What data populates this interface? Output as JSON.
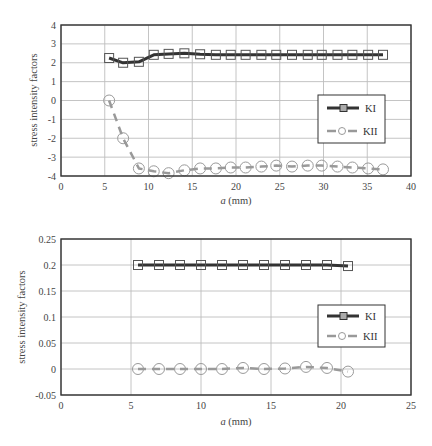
{
  "chart_data": [
    {
      "type": "line",
      "title": "",
      "xlabel": "a (mm)",
      "ylabel": "stress intensity factors",
      "xlim": [
        0,
        40
      ],
      "ylim": [
        -4,
        4
      ],
      "xticks": [
        0,
        5,
        10,
        15,
        20,
        25,
        30,
        35,
        40
      ],
      "yticks": [
        -4,
        -3,
        -2,
        -1,
        0,
        1,
        2,
        3,
        4
      ],
      "grid": true,
      "legend_position": "right-lower inside",
      "series": [
        {
          "name": "KI",
          "marker": "square",
          "line": "solid",
          "color": "#333333",
          "x": [
            5.5,
            7.1,
            8.9,
            10.6,
            12.3,
            14.1,
            15.9,
            17.7,
            19.4,
            21.1,
            22.9,
            24.6,
            26.4,
            28.2,
            29.8,
            31.6,
            33.3,
            35.1,
            36.8
          ],
          "values": [
            2.25,
            2.0,
            2.05,
            2.42,
            2.47,
            2.5,
            2.45,
            2.42,
            2.42,
            2.42,
            2.42,
            2.42,
            2.42,
            2.42,
            2.42,
            2.42,
            2.42,
            2.42,
            2.42
          ]
        },
        {
          "name": "KII",
          "marker": "circle",
          "line": "dashed",
          "color": "#999999",
          "x": [
            5.5,
            7.1,
            8.9,
            10.6,
            12.3,
            14.1,
            15.9,
            17.7,
            19.4,
            21.1,
            22.9,
            24.6,
            26.4,
            28.2,
            29.8,
            31.6,
            33.3,
            35.1,
            36.8
          ],
          "values": [
            0.0,
            -2.0,
            -3.6,
            -3.75,
            -3.85,
            -3.7,
            -3.6,
            -3.6,
            -3.55,
            -3.55,
            -3.5,
            -3.45,
            -3.5,
            -3.45,
            -3.45,
            -3.5,
            -3.55,
            -3.6,
            -3.65
          ]
        }
      ]
    },
    {
      "type": "line",
      "title": "",
      "xlabel": "a (mm)",
      "ylabel": "stress intensity factors",
      "xlim": [
        0,
        25
      ],
      "ylim": [
        -0.05,
        0.25
      ],
      "xticks": [
        0,
        5,
        10,
        15,
        20,
        25
      ],
      "yticks": [
        -0.05,
        0,
        0.05,
        0.1,
        0.15,
        0.2,
        0.25
      ],
      "grid": true,
      "legend_position": "right-middle inside",
      "series": [
        {
          "name": "KI",
          "marker": "square",
          "line": "solid",
          "color": "#333333",
          "x": [
            5.5,
            7.0,
            8.5,
            10.0,
            11.5,
            13.0,
            14.5,
            16.0,
            17.5,
            19.0,
            20.5
          ],
          "values": [
            0.2,
            0.2,
            0.2,
            0.2,
            0.2,
            0.2,
            0.2,
            0.2,
            0.2,
            0.2,
            0.198
          ]
        },
        {
          "name": "KII",
          "marker": "circle",
          "line": "dashed",
          "color": "#999999",
          "x": [
            5.5,
            7.0,
            8.5,
            10.0,
            11.5,
            13.0,
            14.5,
            16.0,
            17.5,
            19.0,
            20.5
          ],
          "values": [
            0.0,
            0.0,
            0.0,
            0.0,
            0.0,
            0.002,
            0.0,
            0.001,
            0.004,
            0.002,
            -0.005
          ]
        }
      ]
    }
  ],
  "charts": [
    {
      "ylabel": "stress intensity factors",
      "xlabel_italic": "a",
      "xlabel_unit": " (mm)",
      "ytick_labels": [
        "4",
        "3",
        "2",
        "1",
        "0",
        "-1",
        "-2",
        "-3",
        "-4"
      ],
      "xtick_labels": [
        "0",
        "5",
        "10",
        "15",
        "20",
        "25",
        "30",
        "35",
        "40"
      ],
      "legend": [
        "KI",
        "KII"
      ]
    },
    {
      "ylabel": "stress intensity factors",
      "xlabel_italic": "a",
      "xlabel_unit": " (mm)",
      "ytick_labels": [
        "0.25",
        "0.2",
        "0.15",
        "0.1",
        "0.05",
        "0",
        "-0.05"
      ],
      "xtick_labels": [
        "0",
        "5",
        "10",
        "15",
        "20",
        "25"
      ],
      "legend": [
        "KI",
        "KII"
      ]
    }
  ]
}
